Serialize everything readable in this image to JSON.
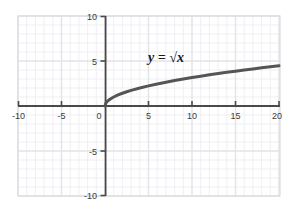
{
  "chart_data": {
    "type": "line",
    "title": "",
    "subtitle": "",
    "xlabel": "",
    "ylabel": "",
    "xlim": [
      -10,
      20
    ],
    "ylim": [
      -10,
      10
    ],
    "xticks": [
      -10,
      -5,
      0,
      5,
      10,
      15,
      20
    ],
    "xtick_labels": [
      "-10",
      "-5",
      "0",
      "5",
      "10",
      "15",
      "20"
    ],
    "yticks": [
      -10,
      -5,
      0,
      5,
      10
    ],
    "ytick_labels": [
      "-10",
      "-5",
      "0",
      "5",
      "10"
    ],
    "grid": true,
    "grid_minor_step": 1,
    "grid_major_step": 5,
    "legend": "none",
    "annotations": [
      {
        "text": "y = √x",
        "x": 7.0,
        "y": 6.2
      }
    ],
    "series": [
      {
        "name": "y = √x",
        "color": "#555555",
        "line_width": 3,
        "x": [
          0,
          0.1,
          0.2,
          0.3,
          0.4,
          0.5,
          0.75,
          1,
          1.5,
          2,
          2.5,
          3,
          4,
          5,
          6,
          7,
          8,
          9,
          10,
          11,
          12,
          13,
          14,
          15,
          16,
          17,
          18,
          19,
          20
        ],
        "values": [
          0,
          0.316,
          0.447,
          0.548,
          0.632,
          0.707,
          0.866,
          1,
          1.225,
          1.414,
          1.581,
          1.732,
          2,
          2.236,
          2.449,
          2.646,
          2.828,
          3,
          3.162,
          3.317,
          3.464,
          3.606,
          3.742,
          3.873,
          4,
          4.123,
          4.243,
          4.359,
          4.472
        ]
      }
    ]
  },
  "axis_labels": {
    "x_neg_10": "-10",
    "x_neg_5": "-5",
    "x_0": "0",
    "x_5": "5",
    "x_10": "10",
    "x_15": "15",
    "x_20": "20",
    "y_10": "10",
    "y_5": "5",
    "y_neg_5": "-5",
    "y_neg_10": "-10"
  },
  "annotation": {
    "equation": "y = √x"
  },
  "colors": {
    "curve": "#555555",
    "axis": "#4a4a4a",
    "grid_minor": "#ececf2",
    "grid_major": "#e0e0e8",
    "plot_border": "#d8d8de",
    "background": "#ffffff",
    "tick_text": "#3a3a3a"
  }
}
